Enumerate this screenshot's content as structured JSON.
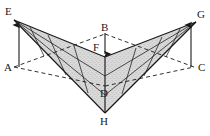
{
  "figure": {
    "type": "line-diagram",
    "background_color": "#ffffff",
    "stroke_color": "#1a1a1a",
    "fill_color": "#cfcfcf",
    "fill_opacity": 0.55,
    "stipple_color": "#7a7a7a",
    "canvas": {
      "width": 210,
      "height": 136
    },
    "labels": [
      {
        "id": "E",
        "text": "E",
        "x": 5,
        "y": 6,
        "vertex_x": 14,
        "vertex_y": 20
      },
      {
        "id": "G",
        "text": "G",
        "x": 197,
        "y": 9,
        "vertex_x": 196,
        "vertex_y": 22
      },
      {
        "id": "A",
        "text": "A",
        "x": 4,
        "y": 62,
        "vertex_x": 14,
        "vertex_y": 67
      },
      {
        "id": "C",
        "text": "C",
        "x": 198,
        "y": 62,
        "vertex_x": 194,
        "vertex_y": 67
      },
      {
        "id": "B",
        "text": "B",
        "x": 101,
        "y": 24,
        "vertex_x": 105,
        "vertex_y": 34
      },
      {
        "id": "F",
        "text": "F",
        "x": 93,
        "y": 44,
        "vertex_x": 105,
        "vertex_y": 57
      },
      {
        "id": "D",
        "text": "D",
        "x": 100,
        "y": 90,
        "vertex_x": 105,
        "vertex_y": 86
      },
      {
        "id": "H",
        "text": "H",
        "x": 100,
        "y": 118,
        "vertex_x": 105,
        "vertex_y": 113
      }
    ],
    "arrows": [
      {
        "id": "arrow-A-to-E",
        "from": "A",
        "to": "E",
        "x1": 19,
        "y1": 67,
        "x2": 19,
        "y2": 22,
        "direction": "up"
      },
      {
        "id": "arrow-C-to-G",
        "from": "C",
        "to": "G",
        "x1": 191,
        "y1": 67,
        "x2": 191,
        "y2": 22,
        "direction": "up"
      },
      {
        "id": "arrow-B-to-F",
        "from": "B",
        "to": "F",
        "x1": 105,
        "y1": 32,
        "x2": 105,
        "y2": 57,
        "direction": "down"
      }
    ],
    "solid_edges": [
      {
        "id": "E-H",
        "x1": 14,
        "y1": 20,
        "x2": 105,
        "y2": 113
      },
      {
        "id": "G-H",
        "x1": 196,
        "y1": 22,
        "x2": 105,
        "y2": 113
      },
      {
        "id": "E-F",
        "x1": 14,
        "y1": 20,
        "x2": 105,
        "y2": 57
      },
      {
        "id": "G-F",
        "x1": 196,
        "y1": 22,
        "x2": 105,
        "y2": 57
      },
      {
        "id": "F-H",
        "x1": 105,
        "y1": 57,
        "x2": 105,
        "y2": 113
      }
    ],
    "dashed_edges": [
      {
        "id": "A-B",
        "x1": 14,
        "y1": 67,
        "x2": 105,
        "y2": 34
      },
      {
        "id": "B-C",
        "x1": 105,
        "y1": 34,
        "x2": 194,
        "y2": 67
      },
      {
        "id": "A-D",
        "x1": 14,
        "y1": 67,
        "x2": 105,
        "y2": 86
      },
      {
        "id": "D-C",
        "x1": 105,
        "y1": 86,
        "x2": 194,
        "y2": 67
      }
    ],
    "grid_lines_left": 3,
    "grid_lines_right": 3
  }
}
